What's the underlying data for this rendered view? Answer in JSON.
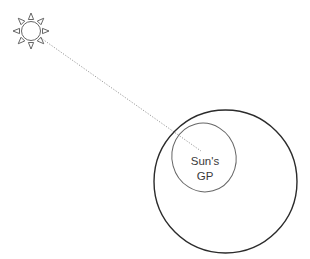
{
  "diagram": {
    "type": "geographic-position-illustration",
    "sun": {
      "icon": "sun-icon",
      "center": [
        31,
        31
      ],
      "radius": 9.5,
      "ray_count": 8,
      "stroke_color": "#555555"
    },
    "ray_line": {
      "style": "dotted",
      "from": [
        31,
        31
      ],
      "to": [
        201,
        151
      ],
      "color": "#9a9a9a"
    },
    "outer_circle": {
      "name": "earth",
      "center": [
        225.5,
        181.5
      ],
      "radius": 71.5,
      "stroke_color": "#2b2b2b",
      "stroke_width": 1.4
    },
    "inner_ellipse": {
      "name": "circle-of-equal-altitude",
      "center": [
        204,
        157.5
      ],
      "rx": 32,
      "ry": 34.5,
      "rotation": -15,
      "stroke_color": "#666666",
      "stroke_width": 1
    },
    "label": {
      "lines": [
        "Sun's",
        "GP"
      ],
      "center_x": 205,
      "line1_y": 165,
      "line2_y": 180
    }
  }
}
